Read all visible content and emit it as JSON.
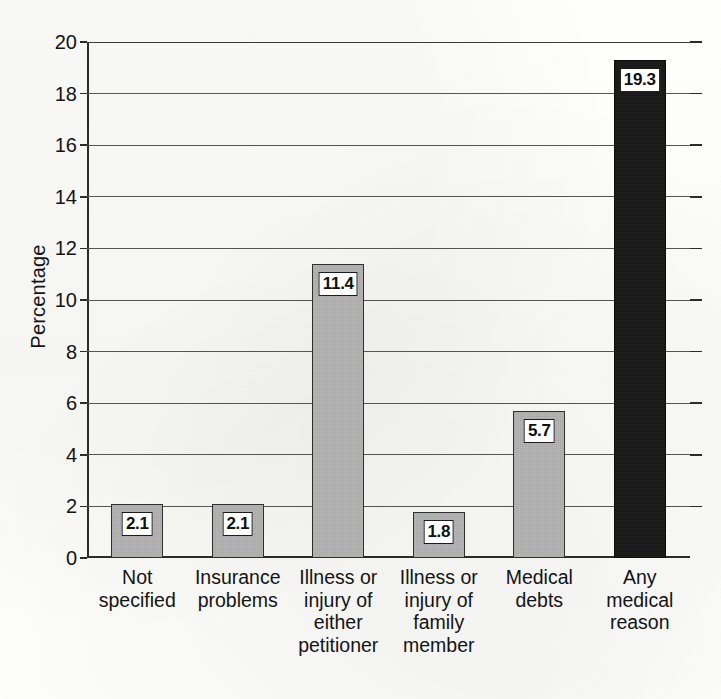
{
  "chart_data": {
    "type": "bar",
    "title": "",
    "subtitle": "",
    "xlabel": "",
    "ylabel": "Percentage",
    "ylim": [
      0,
      20
    ],
    "ytick_step": 2,
    "yticks": [
      "20",
      "18",
      "16",
      "14",
      "12",
      "10",
      "8",
      "6",
      "4",
      "2",
      "0"
    ],
    "grid": true,
    "legend": "none",
    "categories": [
      "Not specified",
      "Insurance problems",
      "Illness or injury of either petitioner",
      "Illness or injury of family member",
      "Medical debts",
      "Any medical reason"
    ],
    "category_lines": [
      [
        "Not",
        "specified"
      ],
      [
        "Insurance",
        "problems"
      ],
      [
        "Illness or",
        "injury of",
        "either",
        "petitioner"
      ],
      [
        "Illness or",
        "injury of",
        "family",
        "member"
      ],
      [
        "Medical",
        "debts"
      ],
      [
        "Any",
        "medical",
        "reason"
      ]
    ],
    "values": [
      2.1,
      2.1,
      11.4,
      1.8,
      5.7,
      19.3
    ],
    "value_labels": [
      "2.1",
      "2.1",
      "11.4",
      "1.8",
      "5.7",
      "19.3"
    ],
    "bar_styles": [
      "gray",
      "gray",
      "gray",
      "gray",
      "gray",
      "dark"
    ],
    "colors": {
      "bar_gray": "#b7b7b7",
      "bar_dark": "#171717",
      "bar_border": "#2f2f2f",
      "axis": "#2b2b2b",
      "gridline": "#555555",
      "text": "#141414",
      "background": "#fdfdfb",
      "label_box_fill": "#ffffff",
      "label_box_border": "#1c1c1c"
    }
  },
  "axis": {
    "y_title": "Percentage"
  }
}
